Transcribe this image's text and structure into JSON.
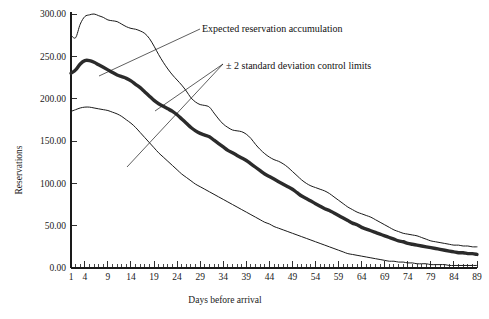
{
  "chart_data": {
    "type": "line",
    "title": "",
    "xlabel": "Days before arrival",
    "ylabel": "Reservations",
    "xlim": [
      1,
      89
    ],
    "ylim": [
      0,
      300
    ],
    "grid": false,
    "legend_position": "annotations-inline",
    "x_tick_labels": [
      "1",
      "4",
      "9",
      "14",
      "19",
      "24",
      "29",
      "34",
      "39",
      "44",
      "49",
      "54",
      "59",
      "64",
      "69",
      "74",
      "79",
      "84",
      "89"
    ],
    "x_tick_values": [
      1,
      4,
      9,
      14,
      19,
      24,
      29,
      34,
      39,
      44,
      49,
      54,
      59,
      64,
      69,
      74,
      79,
      84,
      89
    ],
    "y_tick_labels": [
      "0.00",
      "50.00",
      "100.00",
      "150.00",
      "200.00",
      "250.00",
      "300.00"
    ],
    "y_tick_values": [
      0,
      50,
      100,
      150,
      200,
      250,
      300
    ],
    "x": [
      1,
      2,
      3,
      4,
      5,
      6,
      7,
      8,
      9,
      10,
      11,
      12,
      13,
      14,
      15,
      16,
      17,
      18,
      19,
      20,
      21,
      22,
      23,
      24,
      25,
      26,
      27,
      28,
      29,
      30,
      31,
      32,
      33,
      34,
      35,
      36,
      37,
      38,
      39,
      40,
      41,
      42,
      43,
      44,
      45,
      46,
      47,
      48,
      49,
      50,
      51,
      52,
      53,
      54,
      55,
      56,
      57,
      58,
      59,
      60,
      61,
      62,
      63,
      64,
      65,
      66,
      67,
      68,
      69,
      70,
      71,
      72,
      73,
      74,
      75,
      76,
      77,
      78,
      79,
      80,
      81,
      82,
      83,
      84,
      85,
      86,
      87,
      88,
      89
    ],
    "series": [
      {
        "name": "Upper control limit (+2 standard deviations)",
        "style": "thin",
        "values": [
          275,
          272,
          288,
          297,
          299,
          300,
          298,
          296,
          293,
          292,
          291,
          288,
          285,
          283,
          282,
          280,
          277,
          271,
          262,
          252,
          243,
          235,
          228,
          222,
          216,
          209,
          201,
          196,
          193,
          192,
          190,
          183,
          176,
          170,
          166,
          163,
          162,
          161,
          158,
          153,
          146,
          140,
          135,
          131,
          128,
          126,
          123,
          119,
          114,
          109,
          104,
          100,
          97,
          95,
          93,
          91,
          88,
          84,
          80,
          76,
          72,
          69,
          66,
          64,
          62,
          60,
          57,
          54,
          51,
          48,
          45,
          43,
          41,
          40,
          39,
          38,
          36,
          34,
          32,
          31,
          30,
          29,
          28,
          27,
          27,
          26,
          26,
          25,
          25
        ]
      },
      {
        "name": "Expected reservation accumulation",
        "style": "thick",
        "values": [
          230,
          234,
          241,
          245,
          245,
          243,
          240,
          237,
          234,
          231,
          228,
          226,
          224,
          221,
          217,
          213,
          208,
          203,
          198,
          194,
          191,
          188,
          185,
          181,
          176,
          171,
          166,
          162,
          159,
          157,
          155,
          151,
          147,
          143,
          139,
          136,
          133,
          130,
          127,
          123,
          119,
          115,
          111,
          108,
          105,
          102,
          99,
          96,
          93,
          89,
          85,
          82,
          79,
          76,
          73,
          70,
          68,
          65,
          62,
          59,
          56,
          53,
          51,
          48,
          46,
          44,
          42,
          40,
          38,
          36,
          34,
          32,
          31,
          29,
          28,
          27,
          26,
          25,
          24,
          23,
          22,
          21,
          20,
          19,
          18,
          18,
          17,
          17,
          16
        ]
      },
      {
        "name": "Lower control limit (-2 standard deviations)",
        "style": "thin",
        "values": [
          185,
          187,
          189,
          190,
          190,
          189,
          188,
          187,
          186,
          184,
          182,
          179,
          175,
          171,
          166,
          160,
          154,
          148,
          142,
          136,
          131,
          126,
          121,
          116,
          111,
          107,
          103,
          99,
          96,
          93,
          90,
          87,
          84,
          81,
          78,
          75,
          72,
          69,
          66,
          63,
          60,
          57,
          54,
          52,
          49,
          47,
          45,
          43,
          41,
          39,
          37,
          35,
          33,
          31,
          29,
          27,
          25,
          23,
          21,
          19,
          17,
          16,
          15,
          14,
          13,
          12,
          11,
          10,
          9,
          8,
          8,
          7,
          7,
          6,
          6,
          5,
          5,
          5,
          4,
          4,
          4,
          4,
          3,
          3,
          3,
          3,
          3,
          3,
          3
        ]
      }
    ],
    "annotations": [
      {
        "id": "expected-annotation",
        "text": "Expected reservation accumulation",
        "label_x": 202,
        "label_y": 32,
        "leader_points": "200,29 99,76"
      },
      {
        "id": "control-limits-annotation",
        "text": "± 2 standard deviation control limits",
        "label_x": 226,
        "label_y": 69,
        "leader_points_a": "223,64 155,111",
        "leader_points_b": "223,64 127,167"
      }
    ]
  },
  "colors": {
    "background": "#ffffff",
    "axis": "#1a1a1a",
    "expected_line": "#2b2b2b",
    "limit_line": "#1a1a1a",
    "text": "#111111"
  }
}
